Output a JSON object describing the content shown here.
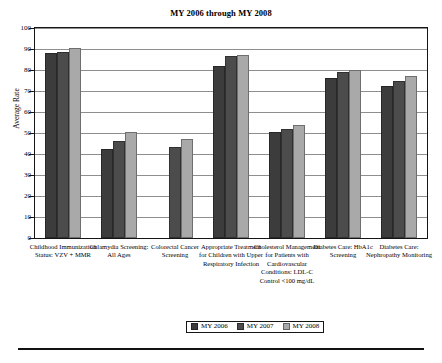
{
  "chart_data": {
    "type": "bar",
    "title": "MY 2006 through MY 2008",
    "xlabel": "",
    "ylabel": "Average Rate",
    "ylim": [
      0,
      100
    ],
    "yticks": [
      0,
      10,
      20,
      30,
      40,
      50,
      60,
      70,
      80,
      90,
      100
    ],
    "grid": true,
    "legend_position": "bottom-center",
    "categories": [
      "Childhood Immunization Status: VZV + MMR",
      "Chlamydia Screening: All Ages",
      "Colorectal Cancer Screening",
      "Appropriate Treatment for Children with Upper Respiratory Infection",
      "Cholesterol Management for Patients with Cardiovascular Conditions: LDL-C Control <100 mg/dL",
      "Diabetes Care: HbA1c Screening",
      "Diabetes Care: Nephropathy Monitoring"
    ],
    "series": [
      {
        "name": "MY 2006",
        "color": "#3c3c3c",
        "values": [
          88.2,
          42.3,
          null,
          81.9,
          50.6,
          76.2,
          72.6
        ]
      },
      {
        "name": "MY 2007",
        "color": "#4c4c4c",
        "values": [
          88.6,
          46.2,
          43.2,
          86.6,
          51.7,
          79.1,
          74.7
        ]
      },
      {
        "name": "MY 2008",
        "color": "#a9a9a9",
        "values": [
          90.3,
          50.7,
          47.3,
          87.0,
          54.0,
          80.2,
          77.3
        ]
      }
    ]
  },
  "axis": {
    "y_title": "Average Rate",
    "y_tick_labels": [
      "100",
      "90",
      "80",
      "70",
      "60",
      "50",
      "40",
      "30",
      "20",
      "10",
      "0"
    ]
  },
  "legend": {
    "entries": [
      {
        "label": "MY 2006",
        "color": "#3c3c3c"
      },
      {
        "label": "MY 2007",
        "color": "#4c4c4c"
      },
      {
        "label": "MY 2008",
        "color": "#a9a9a9"
      }
    ]
  }
}
